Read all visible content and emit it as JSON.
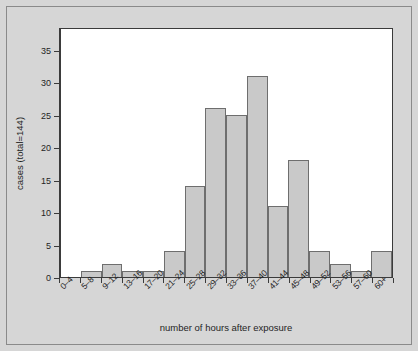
{
  "chart_data": {
    "type": "bar",
    "title": "",
    "subtitle": "",
    "xlabel": "number of hours after exposure",
    "ylabel": "cases (total=144)",
    "categories": [
      "0–4",
      "5–8",
      "9–12",
      "13–16",
      "17–20",
      "21–24",
      "25–28",
      "29–32",
      "33–36",
      "37–40",
      "41–44",
      "45–48",
      "49–52",
      "53–56",
      "57–60",
      "60+"
    ],
    "values": [
      0,
      1,
      2,
      1,
      1,
      4,
      14,
      26,
      25,
      31,
      11,
      18,
      4,
      2,
      1,
      4
    ],
    "ylim": [
      0,
      38.5
    ],
    "yticks": [
      0,
      5,
      10,
      15,
      20,
      25,
      30,
      35
    ],
    "ytick_labels": [
      "0",
      "5",
      "10",
      "15",
      "20",
      "25",
      "30",
      "35"
    ],
    "grid": false,
    "legend": "none",
    "bar_fill": "#c9c9c9",
    "bar_edge": "#6e6e6e",
    "panel_bg": "#ffffff",
    "figure_bg": "#d6d6d6",
    "axis_color": "#3b3b3b"
  }
}
